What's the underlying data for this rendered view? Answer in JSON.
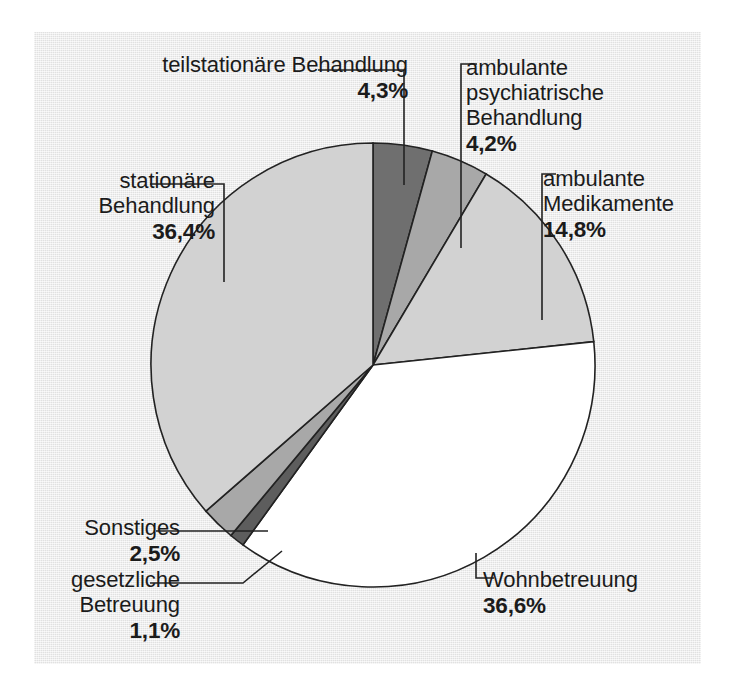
{
  "figure": {
    "background_color": "#eaeaea",
    "page_color": "#ffffff",
    "outline_color": "#222222"
  },
  "chart_data": {
    "type": "pie",
    "title": "",
    "subtitle": "",
    "xlabel": "",
    "ylabel": "",
    "legend_position": "none",
    "grid": false,
    "unit": "%",
    "decimal_separator": ",",
    "start_angle_deg": 0,
    "direction": "clockwise",
    "center": {
      "x": 373,
      "y": 365
    },
    "radius": 222,
    "categories": [
      "teilstationäre Behandlung",
      "ambulante psychiatrische Behandlung",
      "ambulante Medikamente",
      "Wohnbetreuung",
      "gesetzliche Betreuung",
      "Sonstiges",
      "stationäre Behandlung"
    ],
    "values": [
      4.3,
      4.2,
      14.8,
      36.6,
      1.1,
      2.5,
      36.4
    ],
    "value_labels": [
      "4,3%",
      "4,2%",
      "14,8%",
      "36,6%",
      "1,1%",
      "2,5%",
      "36,4%"
    ],
    "colors": [
      "#6f6f6f",
      "#a8a8a8",
      "#d2d2d2",
      "#ffffff",
      "#5d5d5d",
      "#a8a8a8",
      "#d2d2d2"
    ],
    "slices": [
      {
        "label": "teilstationäre Behandlung",
        "value": 4.3,
        "value_label": "4,3%",
        "color": "#6f6f6f"
      },
      {
        "label": "ambulante psychiatrische Behandlung",
        "value": 4.2,
        "value_label": "4,2%",
        "color": "#a8a8a8"
      },
      {
        "label": "ambulante Medikamente",
        "value": 14.8,
        "value_label": "14,8%",
        "color": "#d2d2d2"
      },
      {
        "label": "Wohnbetreuung",
        "value": 36.6,
        "value_label": "36,6%",
        "color": "#ffffff"
      },
      {
        "label": "gesetzliche Betreuung",
        "value": 1.1,
        "value_label": "1,1%",
        "color": "#5d5d5d"
      },
      {
        "label": "Sonstiges",
        "value": 2.5,
        "value_label": "2,5%",
        "color": "#a8a8a8"
      },
      {
        "label": "stationäre Behandlung",
        "value": 36.4,
        "value_label": "36,4%",
        "color": "#d2d2d2"
      }
    ]
  },
  "labels": {
    "teilstationaer": {
      "line1": "teilstationäre Behandlung",
      "pct": "4,3%"
    },
    "ambulante_psychiatrische": {
      "line1": "ambulante",
      "line2": "psychiatrische",
      "line3": "Behandlung",
      "pct": "4,2%"
    },
    "ambulante_medikamente": {
      "line1": "ambulante",
      "line2": "Medikamente",
      "pct": "14,8%"
    },
    "stationaer": {
      "line1": "stationäre",
      "line2": "Behandlung",
      "pct": "36,4%"
    },
    "sonstiges": {
      "line1": "Sonstiges",
      "pct": "2,5%"
    },
    "gesetzliche_betreuung": {
      "line1": "gesetzliche",
      "line2": "Betreuung",
      "pct": "1,1%"
    },
    "wohnbetreuung": {
      "line1": "Wohnbetreuung",
      "pct": "36,6%"
    }
  }
}
